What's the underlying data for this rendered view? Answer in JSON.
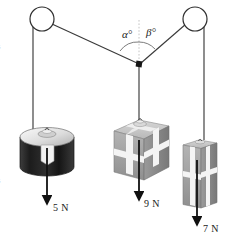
{
  "figure": {
    "background_color": "#ffffff",
    "line_color": "#3a3a3a",
    "arrow_color": "#111111"
  },
  "pulleys": [
    {
      "name": "left-pulley",
      "cx": 42,
      "cy": 19,
      "r": 12
    },
    {
      "name": "right-pulley",
      "cx": 195,
      "cy": 19,
      "r": 12
    }
  ],
  "junction": {
    "name": "cord-junction-knot",
    "x": 139,
    "y": 64,
    "size": 5
  },
  "angles": [
    {
      "name": "alpha",
      "label": "α°",
      "x": 122,
      "y": 29
    },
    {
      "name": "beta",
      "label": "β°",
      "x": 146,
      "y": 27
    }
  ],
  "weights": [
    {
      "name": "left-weight-cylinder",
      "shape": "cylinder",
      "color_body": "#2e2e2e",
      "color_top": "#e8e8e8",
      "force_label": "5 N",
      "force_value": 5,
      "force_unit": "N",
      "label_x": 53,
      "label_y": 203
    },
    {
      "name": "center-weight-cube",
      "shape": "cube",
      "color_body": "#a8a8a8",
      "color_top": "#c9c9c9",
      "force_label": "9 N",
      "force_value": 9,
      "force_unit": "N",
      "label_x": 144,
      "label_y": 199
    },
    {
      "name": "right-weight-block",
      "shape": "block",
      "color_body": "#a8a8a8",
      "color_top": "#c9c9c9",
      "force_label": "7 N",
      "force_value": 7,
      "force_unit": "N",
      "label_x": 203,
      "label_y": 224
    }
  ],
  "edge_marks": {
    "top_clipped": "s",
    "bottom_clipped": "s"
  }
}
